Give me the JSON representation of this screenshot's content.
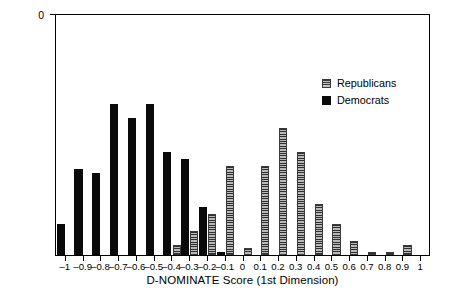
{
  "chart_data": {
    "type": "bar",
    "title": "",
    "xlabel": "D-NOMINATE Score (1st Dimension)",
    "ylabel": "Number of Representatives",
    "xlim": [
      -1.05,
      1.05
    ],
    "ylim": [
      0,
      70
    ],
    "ytick_values": [
      0,
      10,
      20,
      30,
      40,
      50,
      60,
      70
    ],
    "ytick_labels": [
      "0",
      "10",
      "20",
      "30",
      "40",
      "50",
      "60",
      "70"
    ],
    "xtick_values": [
      -1,
      -0.9,
      -0.8,
      -0.7,
      -0.6,
      -0.5,
      -0.4,
      -0.3,
      -0.2,
      -0.1,
      0,
      0.1,
      0.2,
      0.3,
      0.4,
      0.5,
      0.6,
      0.7,
      0.8,
      0.9,
      1
    ],
    "xtick_labels": [
      "–1",
      "–0.9",
      "–0.8",
      "–0.7",
      "–0.6",
      "–0.5",
      "–0.4",
      "–0.3",
      "–0.2",
      "–0.1",
      "0",
      "0.1",
      "0.2",
      "0.3",
      "0.4",
      "0.5",
      "0.6",
      "0.7",
      "0.8",
      "0.9",
      "1"
    ],
    "grid": false,
    "legend_position": "upper right",
    "bin_width": 0.1,
    "series": [
      {
        "name": "Democrats",
        "color": "#0a0a0a",
        "fill": "solid",
        "x": [
          -1.0,
          -0.9,
          -0.8,
          -0.7,
          -0.6,
          -0.5,
          -0.4,
          -0.3,
          -0.2,
          -0.1
        ],
        "values": [
          9,
          25,
          24,
          44,
          40,
          44,
          30,
          28,
          14,
          1
        ]
      },
      {
        "name": "Republicans",
        "color": "#7a7a7a",
        "fill": "horizontal-hatch",
        "x": [
          -0.4,
          -0.3,
          -0.2,
          -0.1,
          0.0,
          0.1,
          0.2,
          0.3,
          0.4,
          0.5,
          0.6,
          0.7,
          0.8,
          0.9
        ],
        "values": [
          3,
          7,
          12,
          26,
          2,
          26,
          37,
          30,
          15,
          9,
          4,
          1,
          1,
          3
        ]
      }
    ]
  },
  "legend": {
    "entries": [
      {
        "label": "Republicans",
        "swatch": "rep"
      },
      {
        "label": "Democrats",
        "swatch": "dem"
      }
    ]
  }
}
